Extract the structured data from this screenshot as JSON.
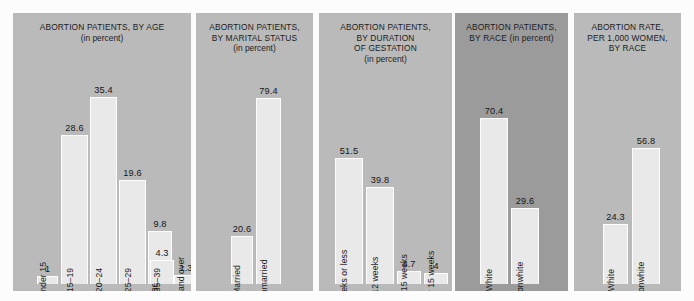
{
  "chart_data": [
    {
      "type": "bar",
      "title": "ABORTION PATIENTS, BY AGE",
      "subtitle": "(in percent)",
      "categories": [
        "Under 15",
        "15–19",
        "20–24",
        "25–29",
        "30–34",
        "35–39",
        "40 and over"
      ],
      "values": [
        1,
        28.6,
        35.4,
        19.6,
        9.8,
        4.3,
        1.3
      ],
      "value_labels": [
        "1",
        "28.6",
        "35.4",
        "19.6",
        "9.8",
        "4.3",
        "1.3"
      ],
      "xlabel": "",
      "ylabel": "",
      "ylim": [
        0,
        35.4
      ],
      "grid": false,
      "legend": "none"
    },
    {
      "type": "bar",
      "title": "ABORTION PATIENTS, BY MARITAL STATUS",
      "subtitle": "(in percent)",
      "categories": [
        "Married",
        "Unmarried"
      ],
      "values": [
        20.6,
        79.4
      ],
      "value_labels": [
        "20.6",
        "79.4"
      ],
      "xlabel": "",
      "ylabel": "",
      "ylim": [
        0,
        79.4
      ],
      "grid": false,
      "legend": "none"
    },
    {
      "type": "bar",
      "title": "ABORTION PATIENTS, BY DURATION OF GESTATION",
      "subtitle": "(in percent)",
      "categories": [
        "8 weeks or less",
        "9–12 weeks",
        "13–15 weeks",
        "Over 15 weeks"
      ],
      "values": [
        51.5,
        39.8,
        4.7,
        4
      ],
      "value_labels": [
        "51.5",
        "39.8",
        "4.7",
        "4"
      ],
      "xlabel": "",
      "ylabel": "",
      "ylim": [
        0,
        51.5
      ],
      "grid": false,
      "legend": "none"
    },
    {
      "type": "bar",
      "title": "ABORTION PATIENTS, BY RACE (in percent)",
      "subtitle": "",
      "categories": [
        "White",
        "Nonwhite"
      ],
      "values": [
        70.4,
        29.6
      ],
      "value_labels": [
        "70.4",
        "29.6"
      ],
      "xlabel": "",
      "ylabel": "",
      "ylim": [
        0,
        70.4
      ],
      "grid": false,
      "legend": "none"
    },
    {
      "type": "bar",
      "title": "ABORTION RATE, PER 1,000 WOMEN, BY RACE",
      "subtitle": "",
      "categories": [
        "White",
        "Nonwhite"
      ],
      "values": [
        24.3,
        56.8
      ],
      "value_labels": [
        "24.3",
        "56.8"
      ],
      "xlabel": "",
      "ylabel": "",
      "ylim": [
        0,
        56.8
      ],
      "grid": false,
      "legend": "none"
    }
  ],
  "panels": [
    {
      "title_lines": [
        "ABORTION PATIENTS, BY AGE",
        "(in percent)"
      ],
      "background": "#bababa",
      "bars": [
        {
          "label": "Under 15",
          "value_label": "1",
          "left": 24,
          "width": 21,
          "height": 8,
          "label_outside": true,
          "value_pos": "inside"
        },
        {
          "label": "15–19",
          "value_label": "28.6",
          "left": 48,
          "width": 27,
          "height": 149,
          "label_outside": false,
          "value_pos": "above"
        },
        {
          "label": "20–24",
          "value_label": "35.4",
          "left": 77,
          "width": 27,
          "height": 187,
          "label_outside": false,
          "value_pos": "above"
        },
        {
          "label": "25–29",
          "value_label": "19.6",
          "left": 106,
          "width": 27,
          "height": 104,
          "label_outside": false,
          "value_pos": "above"
        },
        {
          "label": "30–34",
          "value_label": "9.8",
          "left": 135,
          "width": 24,
          "height": 53,
          "label_outside": false,
          "value_pos": "above"
        },
        {
          "label": "35–39",
          "value_label": "4.3",
          "left": 137,
          "width": 24,
          "height": 24,
          "label_outside": true,
          "value_pos": "above"
        },
        {
          "label": "40 and over",
          "value_label": "1.3",
          "left": 161,
          "width": 24,
          "height": 9,
          "label_outside": true,
          "value_pos": "above"
        }
      ]
    },
    {
      "title_lines": [
        "ABORTION PATIENTS,",
        "BY MARITAL STATUS",
        "(in percent)"
      ],
      "background": "#bababa",
      "bars": [
        {
          "label": "Married",
          "value_label": "20.6",
          "left": 35,
          "width": 22,
          "height": 48,
          "label_outside": false,
          "value_pos": "above"
        },
        {
          "label": "Unmarried",
          "value_label": "79.4",
          "left": 60,
          "width": 25,
          "height": 186,
          "label_outside": false,
          "value_pos": "above"
        }
      ]
    },
    {
      "title_lines": [
        "ABORTION PATIENTS,",
        "BY  DURATION",
        "OF GESTATION",
        "(in percent)"
      ],
      "background": "#bababa",
      "bars": [
        {
          "label": "8 weeks or less",
          "value_label": "51.5",
          "left": 16,
          "width": 28,
          "height": 126,
          "label_outside": false,
          "value_pos": "above"
        },
        {
          "label": "9–12 weeks",
          "value_label": "39.8",
          "left": 47,
          "width": 28,
          "height": 97,
          "label_outside": false,
          "value_pos": "above"
        },
        {
          "label": "13–15 weeks",
          "value_label": "4.7",
          "left": 78,
          "width": 24,
          "height": 13,
          "label_outside": true,
          "value_pos": "above"
        },
        {
          "label": "Over 15 weeks",
          "value_label": "4",
          "left": 105,
          "width": 24,
          "height": 11,
          "label_outside": true,
          "value_pos": "above"
        }
      ]
    },
    {
      "title_lines": [
        "ABORTION PATIENTS,",
        "BY RACE (in percent)"
      ],
      "background": "#9b9b9b",
      "bars": [
        {
          "label": "White",
          "value_label": "70.4",
          "left": 25,
          "width": 28,
          "height": 166,
          "label_outside": false,
          "value_pos": "above"
        },
        {
          "label": "Nonwhite",
          "value_label": "29.6",
          "left": 56,
          "width": 28,
          "height": 76,
          "label_outside": false,
          "value_pos": "above"
        }
      ]
    },
    {
      "title_lines": [
        "ABORTION RATE,",
        "PER 1,000 WOMEN,",
        "BY RACE"
      ],
      "background": "#bababa",
      "bars": [
        {
          "label": "White",
          "value_label": "24.3",
          "left": 29,
          "width": 25,
          "height": 60,
          "label_outside": false,
          "value_pos": "above"
        },
        {
          "label": "Nonwhite",
          "value_label": "56.8",
          "left": 58,
          "width": 28,
          "height": 136,
          "label_outside": false,
          "value_pos": "above"
        }
      ]
    }
  ],
  "panel_geometry": [
    {
      "left": 13,
      "width": 178
    },
    {
      "left": 196,
      "width": 117
    },
    {
      "left": 319,
      "width": 133
    },
    {
      "left": 455,
      "width": 113
    },
    {
      "left": 574,
      "width": 107
    }
  ]
}
